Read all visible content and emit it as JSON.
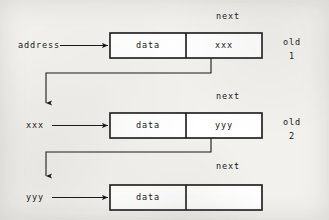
{
  "figure": {
    "ink_color": "#161616",
    "background_color": "#f2f1ee"
  },
  "nodes": [
    {
      "pointer_label": "address",
      "data_label": "data",
      "next_label": "next",
      "next_value": "xxx",
      "tag_line1": "old",
      "tag_line2": "1"
    },
    {
      "pointer_label": "xxx",
      "data_label": "data",
      "next_label": "next",
      "next_value": "yyy",
      "tag_line1": "old",
      "tag_line2": "2"
    },
    {
      "pointer_label": "yyy",
      "data_label": "data",
      "next_label": "next",
      "next_value": "",
      "tag_line1": "",
      "tag_line2": ""
    }
  ]
}
